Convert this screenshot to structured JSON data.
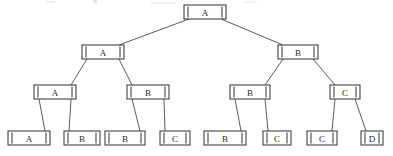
{
  "diagram": {
    "kind": "binary-tree-diagram",
    "levels": 4,
    "node_count": 15,
    "leaf_count": 8,
    "line_color": "#3a3a3a",
    "edge_color": "#4a4a4a",
    "background_color": "#ffffff",
    "label_color": "#1f1f1f",
    "node_style": "rectangle-with-inner-end-ticks",
    "levels_detail": [
      {
        "level": 1,
        "name": "root-level",
        "y": 12,
        "nodes": [
          {
            "id": "n0",
            "label": "A",
            "x": 205,
            "w": 42
          }
        ]
      },
      {
        "level": 2,
        "name": "second-level",
        "y": 52,
        "nodes": [
          {
            "id": "n1",
            "label": "A",
            "x": 103,
            "w": 42
          },
          {
            "id": "n2",
            "label": "B",
            "x": 298,
            "w": 40
          }
        ]
      },
      {
        "level": 3,
        "name": "third-level",
        "y": 92,
        "nodes": [
          {
            "id": "n3",
            "label": "A",
            "x": 55,
            "w": 42
          },
          {
            "id": "n4",
            "label": "B",
            "x": 148,
            "w": 42
          },
          {
            "id": "n5",
            "label": "B",
            "x": 250,
            "w": 40
          },
          {
            "id": "n6",
            "label": "C",
            "x": 345,
            "w": 30
          }
        ]
      },
      {
        "level": 4,
        "name": "leaf-level",
        "y": 138,
        "nodes": [
          {
            "id": "n7",
            "label": "A",
            "x": 29,
            "w": 42
          },
          {
            "id": "n8",
            "label": "B",
            "x": 82,
            "w": 36
          },
          {
            "id": "n9",
            "label": "B",
            "x": 125,
            "w": 40
          },
          {
            "id": "n10",
            "label": "C",
            "x": 175,
            "w": 30
          },
          {
            "id": "n11",
            "label": "B",
            "x": 225,
            "w": 42
          },
          {
            "id": "n12",
            "label": "C",
            "x": 277,
            "w": 28
          },
          {
            "id": "n13",
            "label": "C",
            "x": 322,
            "w": 30
          },
          {
            "id": "n14",
            "label": "D",
            "x": 372,
            "w": 22
          }
        ]
      }
    ],
    "edges": [
      {
        "from": "n0",
        "to": "n1",
        "name": "edge-root-to-left"
      },
      {
        "from": "n0",
        "to": "n2",
        "name": "edge-root-to-right"
      },
      {
        "from": "n1",
        "to": "n3",
        "name": "edge-a1-to-a2"
      },
      {
        "from": "n1",
        "to": "n4",
        "name": "edge-a1-to-b2"
      },
      {
        "from": "n2",
        "to": "n5",
        "name": "edge-b1-to-b2"
      },
      {
        "from": "n2",
        "to": "n6",
        "name": "edge-b1-to-c2"
      },
      {
        "from": "n3",
        "to": "n7",
        "name": "edge-a2-to-leaf-a"
      },
      {
        "from": "n3",
        "to": "n8",
        "name": "edge-a2-to-leaf-b"
      },
      {
        "from": "n4",
        "to": "n9",
        "name": "edge-b2-to-leaf-b"
      },
      {
        "from": "n4",
        "to": "n10",
        "name": "edge-b2-to-leaf-c"
      },
      {
        "from": "n5",
        "to": "n11",
        "name": "edge-b3-to-leaf-b"
      },
      {
        "from": "n5",
        "to": "n12",
        "name": "edge-b3-to-leaf-c"
      },
      {
        "from": "n6",
        "to": "n13",
        "name": "edge-c2-to-leaf-c"
      },
      {
        "from": "n6",
        "to": "n14",
        "name": "edge-c2-to-leaf-d"
      }
    ],
    "label_sequence_by_level": {
      "level_1": [
        "A"
      ],
      "level_2": [
        "A",
        "B"
      ],
      "level_3": [
        "A",
        "B",
        "B",
        "C"
      ],
      "level_4": [
        "A",
        "B",
        "B",
        "C",
        "B",
        "C",
        "C",
        "D"
      ]
    }
  }
}
